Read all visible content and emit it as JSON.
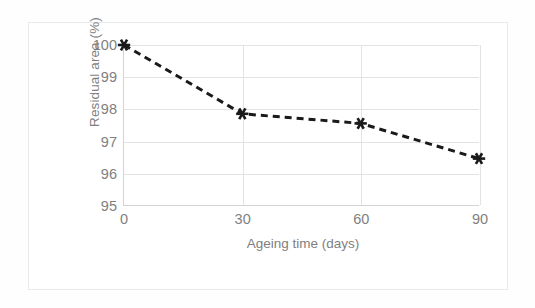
{
  "chart_data": {
    "type": "line",
    "title": "",
    "subtitle": "",
    "xlabel": "Ageing time (days)",
    "ylabel": "Residual area (%)",
    "x": [
      0,
      30,
      60,
      90
    ],
    "xtick_labels": [
      "0",
      "30",
      "60",
      "90"
    ],
    "ytick_labels": [
      "95",
      "96",
      "97",
      "98",
      "99",
      "100"
    ],
    "yticks": [
      95,
      96,
      97,
      98,
      99,
      100
    ],
    "xlim": [
      0,
      90
    ],
    "ylim": [
      95,
      100
    ],
    "grid": "both",
    "legend": "none",
    "series": [
      {
        "name": "Residual area",
        "values": [
          100.0,
          97.85,
          97.55,
          96.45
        ],
        "line_style": "dashed",
        "line_color": "#1a1a1a",
        "line_width": 3,
        "marker": "asterisk",
        "marker_color": "#1a1a1a"
      }
    ]
  },
  "style": {
    "tick_color": "#7f7f7f",
    "axis_title_color": "#7f7f7f",
    "gridline_color": "#e3e3e3",
    "axis_color": "#d4d4d4",
    "frame_border_color": "#e9e9e9",
    "plot_background": "#ffffff",
    "page_background": "#fefefe"
  }
}
